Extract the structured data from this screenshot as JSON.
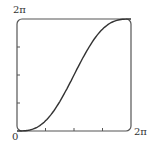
{
  "chart_data": {
    "type": "line",
    "title": "",
    "xlabel": "",
    "ylabel": "",
    "xlim": [
      0,
      6.2832
    ],
    "ylim": [
      0,
      6.2832
    ],
    "grid": false,
    "tick_labels": {
      "x_origin": "0",
      "x_max": "2π",
      "y_max": "2π"
    },
    "ticks": {
      "x_minor_count": 3,
      "y_minor_count": 3
    },
    "series": [
      {
        "name": "x - sin(x)",
        "x": [
          0,
          0.785,
          1.571,
          2.356,
          3.142,
          3.927,
          4.712,
          5.498,
          6.283
        ],
        "values": [
          0,
          0.078,
          0.571,
          1.649,
          3.142,
          4.634,
          5.712,
          6.205,
          6.283
        ]
      }
    ],
    "colors": {
      "line": "#333333",
      "axes": "#555555"
    }
  }
}
